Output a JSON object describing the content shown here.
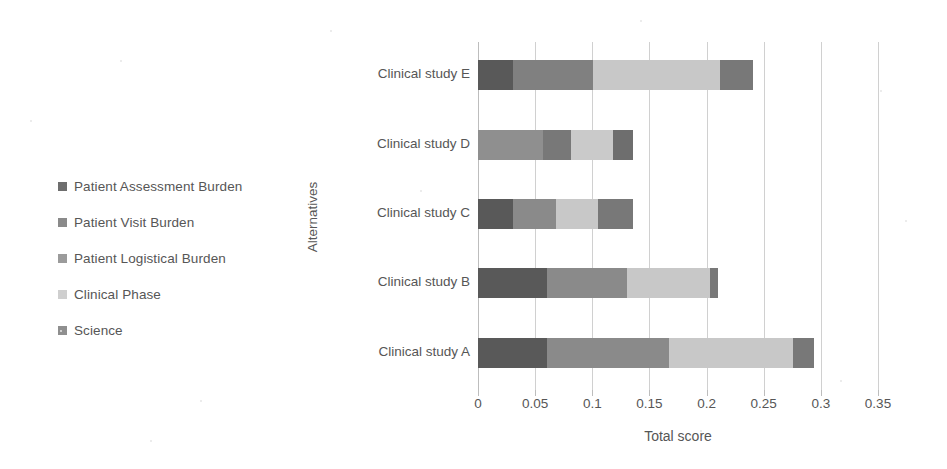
{
  "chart_data": {
    "type": "bar",
    "orientation": "horizontal",
    "stacked": true,
    "title": "",
    "xlabel": "Total score",
    "ylabel": "Alternatives",
    "categories": [
      "Clinical study A",
      "Clinical study B",
      "Clinical study C",
      "Clinical study D",
      "Clinical study E"
    ],
    "category_order_top_to_bottom": [
      "Clinical study E",
      "Clinical study D",
      "Clinical study C",
      "Clinical study B",
      "Clinical study A"
    ],
    "xlim": [
      0,
      0.35
    ],
    "xticks": [
      "0",
      "0.05",
      "0.1",
      "0.15",
      "0.2",
      "0.25",
      "0.3",
      "0.35"
    ],
    "xtick_values": [
      0,
      0.05,
      0.1,
      0.15,
      0.2,
      0.25,
      0.3,
      0.35
    ],
    "grid": "vertical",
    "legend_position": "left",
    "series": [
      {
        "name": "Science",
        "color": "#595959",
        "values": [
          0.06,
          0.06,
          0.031,
          0.0,
          0.031
        ]
      },
      {
        "name": "Clinical Phase",
        "color": "#8a8a8a",
        "values": [
          0.107,
          0.07,
          0.037,
          0.057,
          0.07
        ]
      },
      {
        "name": "Patient Logistical Burden",
        "color": "#c8c8c8",
        "values": [
          0.109,
          0.073,
          0.037,
          0.024,
          0.111
        ]
      },
      {
        "name": "Patient Visit Burden",
        "color": "#7d7d7d",
        "values": [
          0.018,
          0.007,
          0.031,
          0.037,
          0.029
        ]
      },
      {
        "name": "Patient Assessment Burden",
        "color": "#6e6e6e",
        "values": [
          0.0,
          0.0,
          0.0,
          0.018,
          0.0
        ]
      }
    ],
    "totals": [
      0.294,
      0.21,
      0.136,
      0.136,
      0.241
    ],
    "legend_entries": [
      {
        "label": "Patient Assessment Burden",
        "color": "#6e6e6e"
      },
      {
        "label": "Patient Visit Burden",
        "color": "#8a8a8a"
      },
      {
        "label": "Patient Logistical Burden",
        "color": "#9b9b9b"
      },
      {
        "label": "Clinical Phase",
        "color": "#cfcfcf"
      },
      {
        "label": "Science",
        "color": "#8f8f8f"
      }
    ],
    "bar_segments_top_to_bottom": [
      {
        "category": "Clinical study E",
        "segments": [
          {
            "color": "#595959",
            "start": 0.0,
            "end": 0.031
          },
          {
            "color": "#808080",
            "start": 0.031,
            "end": 0.101
          },
          {
            "color": "#c8c8c8",
            "start": 0.101,
            "end": 0.212
          },
          {
            "color": "#787878",
            "start": 0.212,
            "end": 0.241
          }
        ]
      },
      {
        "category": "Clinical study D",
        "segments": [
          {
            "color": "#8f8f8f",
            "start": 0.0,
            "end": 0.057
          },
          {
            "color": "#787878",
            "start": 0.057,
            "end": 0.081
          },
          {
            "color": "#cacaca",
            "start": 0.081,
            "end": 0.118
          },
          {
            "color": "#6e6e6e",
            "start": 0.118,
            "end": 0.136
          }
        ]
      },
      {
        "category": "Clinical study C",
        "segments": [
          {
            "color": "#595959",
            "start": 0.0,
            "end": 0.031
          },
          {
            "color": "#8a8a8a",
            "start": 0.031,
            "end": 0.068
          },
          {
            "color": "#c8c8c8",
            "start": 0.068,
            "end": 0.105
          },
          {
            "color": "#787878",
            "start": 0.105,
            "end": 0.136
          }
        ]
      },
      {
        "category": "Clinical study B",
        "segments": [
          {
            "color": "#595959",
            "start": 0.0,
            "end": 0.06
          },
          {
            "color": "#8a8a8a",
            "start": 0.06,
            "end": 0.13
          },
          {
            "color": "#c8c8c8",
            "start": 0.13,
            "end": 0.203
          },
          {
            "color": "#787878",
            "start": 0.203,
            "end": 0.21
          }
        ]
      },
      {
        "category": "Clinical study A",
        "segments": [
          {
            "color": "#595959",
            "start": 0.0,
            "end": 0.06
          },
          {
            "color": "#8a8a8a",
            "start": 0.06,
            "end": 0.167
          },
          {
            "color": "#c8c8c8",
            "start": 0.167,
            "end": 0.276
          },
          {
            "color": "#787878",
            "start": 0.276,
            "end": 0.294
          }
        ]
      }
    ]
  }
}
